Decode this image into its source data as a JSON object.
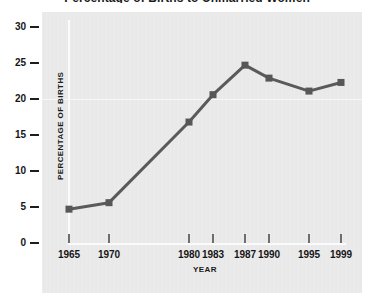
{
  "figure": {
    "title_cropped": "Percentage of Births to Unmarried Women",
    "background_color": "#ffffff",
    "panel_color": "#e9e9e9"
  },
  "chart_data": {
    "type": "line",
    "title": "Percentage of Births to Unmarried Women",
    "xlabel": "YEAR",
    "ylabel": "PERCENTAGE OF BIRTHS",
    "categories": [
      "1965",
      "1970",
      "1980",
      "1983",
      "1987",
      "1990",
      "1995",
      "1999"
    ],
    "x": [
      1965,
      1970,
      1980,
      1983,
      1987,
      1990,
      1995,
      1999
    ],
    "values": [
      4.7,
      5.6,
      16.8,
      20.6,
      24.7,
      22.9,
      21.1,
      22.3
    ],
    "series": [
      {
        "name": "Percentage of births",
        "values": [
          4.7,
          5.6,
          16.8,
          20.6,
          24.7,
          22.9,
          21.1,
          22.3
        ]
      }
    ],
    "ylim": [
      0,
      30
    ],
    "xlim": [
      1963,
      2001
    ],
    "yticks": [
      "0",
      "5",
      "10",
      "15",
      "20",
      "25",
      "30"
    ],
    "ytick_values": [
      0,
      5,
      10,
      15,
      20,
      25,
      30
    ],
    "xticks": [
      "1965",
      "1970",
      "1980",
      "1983",
      "1987",
      "1990",
      "1995",
      "1999"
    ],
    "grid": "horizontal-faint",
    "legend": "none",
    "line_color": "#5a5a5a",
    "marker_color": "#575757",
    "marker_shape": "square"
  }
}
